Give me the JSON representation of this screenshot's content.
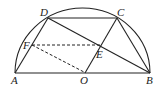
{
  "diagram": {
    "type": "geometry",
    "shape": "semicircle with inscribed quadrilateral",
    "points": {
      "A": {
        "label": "A",
        "x": 15,
        "y": 73
      },
      "B": {
        "label": "B",
        "x": 150,
        "y": 73
      },
      "O": {
        "label": "O",
        "x": 83,
        "y": 73
      },
      "C": {
        "label": "C",
        "x": 117,
        "y": 18
      },
      "D": {
        "label": "D",
        "x": 48,
        "y": 18
      },
      "E": {
        "label": "E",
        "x": 101,
        "y": 45
      },
      "F": {
        "label": "F",
        "x": 32,
        "y": 45
      }
    },
    "solid_segments": [
      "AB",
      "AD",
      "DC",
      "CB",
      "DB",
      "OC"
    ],
    "dashed_segments": [
      "FE",
      "FO"
    ],
    "arc": "semicircle on AB centered at O"
  }
}
